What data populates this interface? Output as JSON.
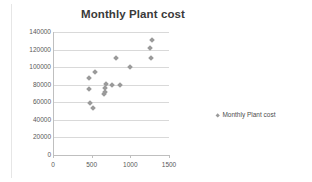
{
  "chart_data": {
    "type": "scatter",
    "title": "Monthly Plant cost",
    "xlabel": "",
    "ylabel": "",
    "xlim": [
      0,
      1500
    ],
    "ylim": [
      0,
      140000
    ],
    "xticks": [
      0,
      500,
      1000,
      1500
    ],
    "yticks": [
      0,
      20000,
      40000,
      60000,
      80000,
      100000,
      120000,
      140000
    ],
    "grid": true,
    "legend_position": "right",
    "series": [
      {
        "name": "Monthly Plant cost",
        "marker": "diamond",
        "color": "#9a9a9a",
        "points": [
          [
            460,
            88000
          ],
          [
            470,
            75000
          ],
          [
            480,
            59000
          ],
          [
            520,
            53000
          ],
          [
            545,
            95000
          ],
          [
            660,
            70000
          ],
          [
            668,
            72000
          ],
          [
            672,
            76000
          ],
          [
            685,
            81000
          ],
          [
            760,
            80000
          ],
          [
            820,
            110000
          ],
          [
            870,
            80000
          ],
          [
            1000,
            100000
          ],
          [
            1250,
            122000
          ],
          [
            1270,
            110000
          ],
          [
            1285,
            131000
          ]
        ]
      }
    ],
    "legend": [
      {
        "label": "Monthly Plant cost",
        "marker": "diamond",
        "color": "#9a9a9a"
      }
    ]
  }
}
